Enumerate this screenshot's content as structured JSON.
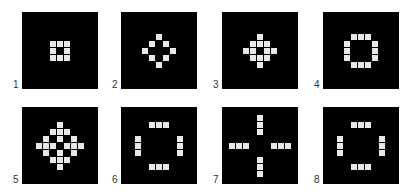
{
  "figure": {
    "background": "#ffffff",
    "panel_color": "#000000",
    "cell_color": "#e8e8e8",
    "panels": [
      {
        "label": "1",
        "rows": [
          "###",
          "#.#",
          "###"
        ]
      },
      {
        "label": "2",
        "rows": [
          "..#..",
          ".#.#.",
          "#...#",
          ".#.#.",
          "..#.."
        ]
      },
      {
        "label": "3",
        "rows": [
          "..#..",
          ".###.",
          "##.##",
          ".###.",
          "..#.."
        ]
      },
      {
        "label": "4",
        "rows": [
          ".###.",
          "#...#",
          "#...#",
          "#...#",
          ".###."
        ]
      },
      {
        "label": "5",
        "rows": [
          "...#...",
          "..###..",
          ".#.#.#.",
          "###.###",
          ".#.#.#.",
          "..###..",
          "...#..."
        ]
      },
      {
        "label": "6",
        "rows": [
          ".......",
          "..###..",
          ".......",
          "#.....#",
          "#.....#",
          "#.....#",
          ".......",
          "..###..",
          "......."
        ]
      },
      {
        "label": "7",
        "rows": [
          "....#....",
          "....#....",
          "....#....",
          ".........",
          "###...###",
          ".........",
          "....#....",
          "....#....",
          "....#...."
        ]
      },
      {
        "label": "8",
        "rows": [
          ".......",
          "..###..",
          ".......",
          "#.....#",
          "#.....#",
          "#.....#",
          ".......",
          "..###..",
          "......."
        ]
      }
    ]
  }
}
